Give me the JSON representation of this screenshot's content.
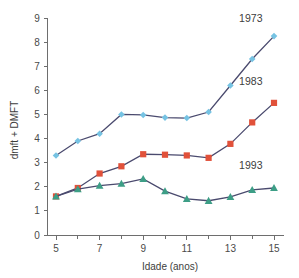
{
  "chart_data": {
    "type": "line",
    "title": "",
    "xlabel": "Idade (anos)",
    "ylabel": "dmft + DMFT",
    "x": [
      5,
      6,
      7,
      8,
      9,
      10,
      11,
      12,
      13,
      14,
      15
    ],
    "xlim": [
      4.6,
      15.4
    ],
    "ylim": [
      0,
      9
    ],
    "x_tick_labels": [
      "5",
      "7",
      "9",
      "11",
      "13",
      "15"
    ],
    "x_tick_values": [
      5,
      7,
      9,
      11,
      13,
      15
    ],
    "x_minor_ticks": [
      6,
      8,
      10,
      12,
      14
    ],
    "y_tick_labels": [
      "0",
      "1",
      "2",
      "3",
      "4",
      "5",
      "6",
      "7",
      "8",
      "9"
    ],
    "y_tick_values": [
      0,
      1,
      2,
      3,
      4,
      5,
      6,
      7,
      8,
      9
    ],
    "grid": false,
    "legend_position": "inline-right",
    "series": [
      {
        "name": "1973",
        "values": [
          3.3,
          3.9,
          4.2,
          5.0,
          4.98,
          4.87,
          4.85,
          5.1,
          6.2,
          7.3,
          8.25
        ],
        "marker": "diamond",
        "marker_color": "#76c3e3",
        "line_color": "#4a4a6e",
        "label_x": 13.4,
        "label_y": 8.82
      },
      {
        "name": "1983",
        "values": [
          1.6,
          1.95,
          2.55,
          2.85,
          3.35,
          3.33,
          3.3,
          3.2,
          3.78,
          4.67,
          5.48
        ],
        "marker": "square",
        "marker_color": "#e1513a",
        "line_color": "#4a4a6e",
        "label_x": 13.4,
        "label_y": 6.22
      },
      {
        "name": "1993",
        "values": [
          1.6,
          1.9,
          2.05,
          2.13,
          2.33,
          1.82,
          1.5,
          1.42,
          1.58,
          1.87,
          1.95
        ],
        "marker": "triangle",
        "marker_color": "#3d9e86",
        "line_color": "#4a6a66",
        "label_x": 13.4,
        "label_y": 2.73
      }
    ]
  },
  "colors": {
    "background": "#ffffff",
    "axis": "#6e6e6e",
    "text": "#3d3d3d",
    "series_1973": "#76c3e3",
    "series_1983": "#e1513a",
    "series_1993": "#3d9e86",
    "connector": "#4a4a6e"
  }
}
